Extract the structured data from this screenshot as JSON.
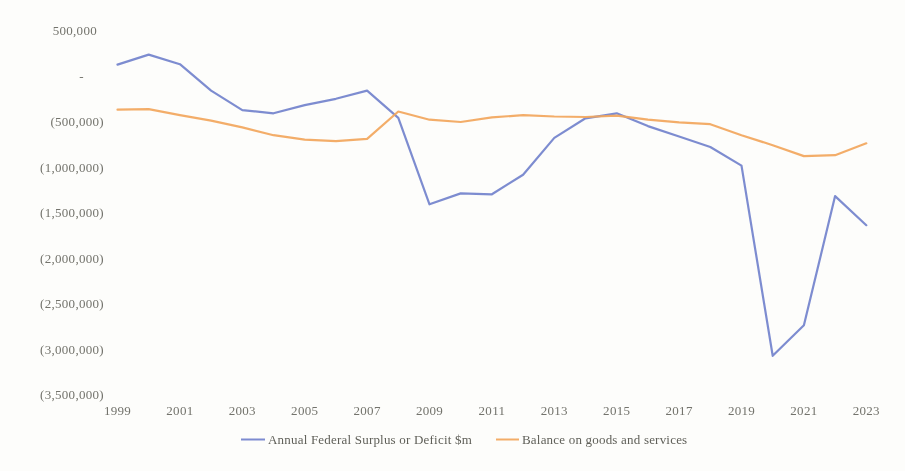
{
  "figure": {
    "background_color": "#fdfdfb",
    "axis_text_color": "#73736c",
    "legend_text_color": "#5f5f58"
  },
  "chart_data": {
    "type": "line",
    "title": "",
    "xlabel": "",
    "ylabel": "",
    "grid": false,
    "legend_position": "bottom-center",
    "ylim": [
      -3500000,
      500000
    ],
    "x": [
      1999,
      2000,
      2001,
      2002,
      2003,
      2004,
      2005,
      2006,
      2007,
      2008,
      2009,
      2010,
      2011,
      2012,
      2013,
      2014,
      2015,
      2016,
      2017,
      2018,
      2019,
      2020,
      2021,
      2022,
      2023
    ],
    "x_tick_labels": [
      "1999",
      "2001",
      "2003",
      "2005",
      "2007",
      "2009",
      "2011",
      "2013",
      "2015",
      "2017",
      "2019",
      "2021",
      "2023"
    ],
    "y_ticks": [
      {
        "value": 500000,
        "label": "500,000"
      },
      {
        "value": 0,
        "label": "-"
      },
      {
        "value": -500000,
        "label": "(500,000)"
      },
      {
        "value": -1000000,
        "label": "(1,000,000)"
      },
      {
        "value": -1500000,
        "label": "(1,500,000)"
      },
      {
        "value": -2000000,
        "label": "(2,000,000)"
      },
      {
        "value": -2500000,
        "label": "(2,500,000)"
      },
      {
        "value": -3000000,
        "label": "(3,000,000)"
      },
      {
        "value": -3500000,
        "label": "(3,500,000)"
      }
    ],
    "series": [
      {
        "name": "Annual Federal Surplus or Deficit $m",
        "color": "#7282cc",
        "values": [
          125000,
          235000,
          130000,
          -160000,
          -375000,
          -410000,
          -320000,
          -250000,
          -160000,
          -460000,
          -1410000,
          -1290000,
          -1300000,
          -1085000,
          -680000,
          -465000,
          -410000,
          -550000,
          -665000,
          -780000,
          -985000,
          -3075000,
          -2740000,
          -1320000,
          -1640000
        ]
      },
      {
        "name": "Balance on goods and services",
        "color": "#f2a65c",
        "values": [
          -370000,
          -365000,
          -430000,
          -490000,
          -565000,
          -650000,
          -700000,
          -715000,
          -690000,
          -390000,
          -480000,
          -505000,
          -455000,
          -430000,
          -445000,
          -450000,
          -435000,
          -480000,
          -510000,
          -530000,
          -650000,
          -760000,
          -880000,
          -870000,
          -740000
        ]
      }
    ]
  }
}
